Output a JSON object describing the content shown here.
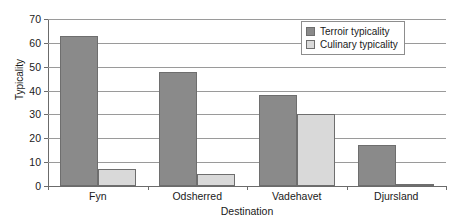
{
  "chart_data": {
    "type": "bar",
    "title": "",
    "xlabel": "Destination",
    "ylabel": "Typicality",
    "categories": [
      "Fyn",
      "Odsherred",
      "Vadehavet",
      "Djursland"
    ],
    "series": [
      {
        "name": "Terroir typicality",
        "values": [
          63,
          48,
          38,
          17
        ],
        "color": "#8a8a8a"
      },
      {
        "name": "Culinary typicality",
        "values": [
          7,
          5,
          30,
          1
        ],
        "color": "#d9d9d9"
      }
    ],
    "ylim": [
      0,
      70
    ],
    "yticks": [
      0,
      10,
      20,
      30,
      40,
      50,
      60,
      70
    ],
    "ytick_labels": [
      "0",
      "10",
      "20",
      "30",
      "40",
      "50",
      "60",
      "70"
    ],
    "grid": "horizontal",
    "legend_position": "top-right"
  }
}
